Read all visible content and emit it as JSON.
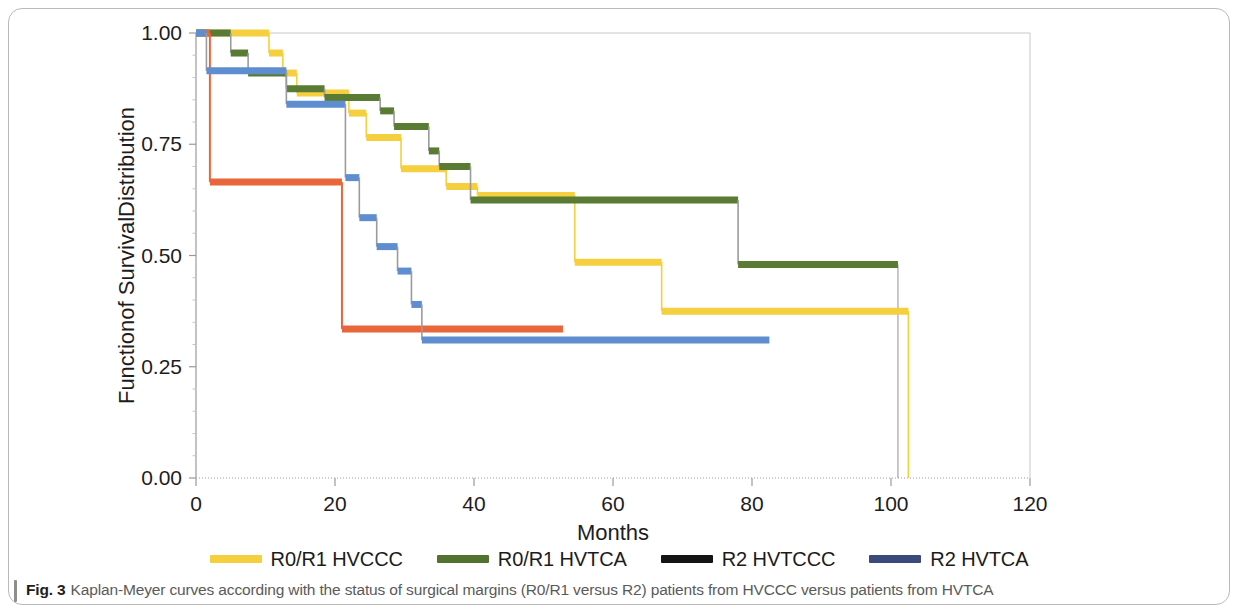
{
  "figure": {
    "caption_prefix": "Fig. 3",
    "caption_text": "Kaplan-Meyer curves according with the status of surgical margins (R0/R1 versus R2) patients from HVCCC versus patients from HVTCA"
  },
  "legend": {
    "position": "bottom-center",
    "items": [
      {
        "label": "R0/R1 HVCCC",
        "color": "#f5cf3e",
        "series": "r0r1_hvccc"
      },
      {
        "label": "R0/R1 HVTCA",
        "color": "#54722f",
        "series": "r0r1_hvtca"
      },
      {
        "label": "R2 HVTCCC",
        "color": "#141414",
        "series": "r2_hvtccc"
      },
      {
        "label": "R2 HVTCA",
        "color": "#3a4a7a",
        "series": "r2_hvtca"
      }
    ]
  },
  "chart_data": {
    "type": "line",
    "subtype": "kaplan-meier-step",
    "title": "",
    "xlabel": "Months",
    "ylabel": "Functionof SurvivalDistribution",
    "xlim": [
      0,
      120
    ],
    "ylim": [
      0.0,
      1.0
    ],
    "xticks": [
      0,
      20,
      40,
      60,
      80,
      100,
      120
    ],
    "xtick_labels": [
      "0",
      "20",
      "40",
      "60",
      "80",
      "100",
      "120"
    ],
    "yticks": [
      0.0,
      0.25,
      0.5,
      0.75,
      1.0
    ],
    "ytick_labels": [
      "0.00",
      "0.25",
      "0.50",
      "0.75",
      "1.00"
    ],
    "grid": false,
    "plot_colors": {
      "r0r1_hvccc": "#f5cf3e",
      "r0r1_hvtca": "#5a7b33",
      "r2_hvtccc": "#e8663a",
      "r2_hvtca": "#5f8ed0",
      "drop_line": "#9b9b9b",
      "axis": "#9a9a9a"
    },
    "series": [
      {
        "name": "R0/R1 HVCCC",
        "key": "r0r1_hvccc",
        "color": "#f5cf3e",
        "points": [
          [
            0,
            1.0
          ],
          [
            10.5,
            1.0
          ],
          [
            10.5,
            0.955
          ],
          [
            12.5,
            0.955
          ],
          [
            12.5,
            0.91
          ],
          [
            14.5,
            0.91
          ],
          [
            14.5,
            0.865
          ],
          [
            22.0,
            0.865
          ],
          [
            22.0,
            0.82
          ],
          [
            24.5,
            0.82
          ],
          [
            24.5,
            0.765
          ],
          [
            29.5,
            0.765
          ],
          [
            29.5,
            0.695
          ],
          [
            36.0,
            0.695
          ],
          [
            36.0,
            0.655
          ],
          [
            40.5,
            0.655
          ],
          [
            40.5,
            0.635
          ],
          [
            54.5,
            0.635
          ],
          [
            54.5,
            0.485
          ],
          [
            67.0,
            0.485
          ],
          [
            67.0,
            0.375
          ],
          [
            102.5,
            0.375
          ],
          [
            102.5,
            0.0
          ]
        ]
      },
      {
        "name": "R0/R1 HVTCA",
        "key": "r0r1_hvtca",
        "color": "#5a7b33",
        "points": [
          [
            0,
            1.0
          ],
          [
            5.0,
            1.0
          ],
          [
            5.0,
            0.955
          ],
          [
            7.5,
            0.955
          ],
          [
            7.5,
            0.91
          ],
          [
            13.0,
            0.91
          ],
          [
            13.0,
            0.875
          ],
          [
            18.5,
            0.875
          ],
          [
            18.5,
            0.855
          ],
          [
            26.5,
            0.855
          ],
          [
            26.5,
            0.825
          ],
          [
            28.5,
            0.825
          ],
          [
            28.5,
            0.79
          ],
          [
            33.5,
            0.79
          ],
          [
            33.5,
            0.735
          ],
          [
            35.0,
            0.735
          ],
          [
            35.0,
            0.7
          ],
          [
            39.5,
            0.7
          ],
          [
            39.5,
            0.625
          ],
          [
            78.0,
            0.625
          ],
          [
            78.0,
            0.48
          ],
          [
            101.0,
            0.48
          ]
        ]
      },
      {
        "name": "R2 HVTCCC",
        "key": "r2_hvtccc",
        "color": "#e8663a",
        "points": [
          [
            0,
            1.0
          ],
          [
            2.0,
            1.0
          ],
          [
            2.0,
            0.665
          ],
          [
            21.0,
            0.665
          ],
          [
            21.0,
            0.335
          ],
          [
            52.8,
            0.335
          ]
        ]
      },
      {
        "name": "R2 HVTCA",
        "key": "r2_hvtca",
        "color": "#5f8ed0",
        "points": [
          [
            0,
            1.0
          ],
          [
            1.5,
            1.0
          ],
          [
            1.5,
            0.915
          ],
          [
            13.0,
            0.915
          ],
          [
            13.0,
            0.84
          ],
          [
            21.5,
            0.84
          ],
          [
            21.5,
            0.675
          ],
          [
            23.5,
            0.675
          ],
          [
            23.5,
            0.585
          ],
          [
            26.0,
            0.585
          ],
          [
            26.0,
            0.52
          ],
          [
            29.0,
            0.52
          ],
          [
            29.0,
            0.465
          ],
          [
            31.0,
            0.465
          ],
          [
            31.0,
            0.39
          ],
          [
            32.5,
            0.39
          ],
          [
            32.5,
            0.31
          ],
          [
            82.5,
            0.31
          ]
        ]
      }
    ],
    "censor_drops": [
      {
        "x": 101.0,
        "y_from": 0.48,
        "y_to": 0.0,
        "series": "r0r1_hvtca"
      }
    ]
  }
}
